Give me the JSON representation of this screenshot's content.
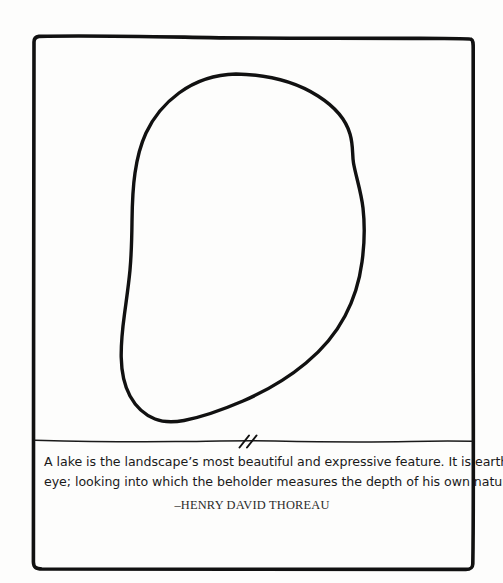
{
  "illustration": {
    "title": "lake-outline-drawing",
    "border_label": "hand-drawn rectangular frame",
    "lake_shape_label": "hand-drawn closed lake outline blob",
    "horizon_line_label": "hand-drawn horizontal rule below lake",
    "break_mark_label": "double diagonal break slashes on horizon line",
    "ink_color": "#111111",
    "background_color": "#fdfdfc"
  },
  "quote": {
    "line1": "A lake is the landscape’s most beautiful and expressive feature. It is earth’s",
    "line2": "eye; looking into which the beholder measures the depth of his own nature.",
    "attribution": "–HENRY DAVID THOREAU"
  }
}
